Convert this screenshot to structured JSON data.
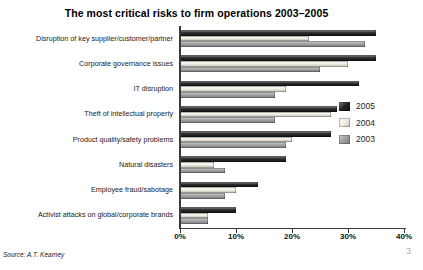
{
  "chart_data": {
    "type": "bar",
    "orientation": "horizontal",
    "title": "The most critical risks to firm operations 2003–2005",
    "categories": [
      "Disruption of key supplier/customer/partner",
      "Corporate governance issues",
      "IT disruption",
      "Theft of intellectual property",
      "Product quality/safety problems",
      "Natural disasters",
      "Employee fraud/sabotage",
      "Activist attacks on global/corporate brands"
    ],
    "series": [
      {
        "name": "2005",
        "color": "#161616",
        "values": [
          35,
          35,
          32,
          28,
          27,
          19,
          14,
          10
        ]
      },
      {
        "name": "2004",
        "color": "#f2efe3",
        "values": [
          23,
          30,
          19,
          27,
          20,
          6,
          10,
          5
        ]
      },
      {
        "name": "2003",
        "color": "#9b9b9b",
        "values": [
          33,
          25,
          17,
          17,
          19,
          8,
          8,
          5
        ]
      }
    ],
    "xlim": [
      0,
      40
    ],
    "x_ticks": [
      "0%",
      "10%",
      "20%",
      "30%",
      "40%"
    ],
    "xlabel": "",
    "ylabel": "",
    "grid": false,
    "legend_position": "right"
  },
  "footer": {
    "source": "Source: A.T. Kearney",
    "page_number": "3"
  }
}
